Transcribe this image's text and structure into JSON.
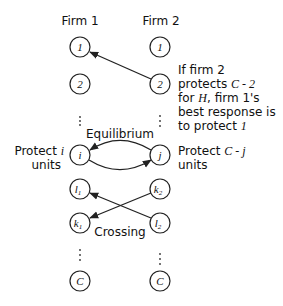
{
  "columns": [
    {
      "id": "firm1",
      "label": "Firm 1",
      "x": 80
    },
    {
      "id": "firm2",
      "label": "Firm 2",
      "x": 160
    }
  ],
  "nodes": {
    "firm1": [
      {
        "id": "f1-1",
        "label": "1",
        "sub": "",
        "y": 47
      },
      {
        "id": "f1-2",
        "label": "2",
        "sub": "",
        "y": 84
      },
      {
        "id": "f1-i",
        "label": "i",
        "sub": "",
        "y": 155
      },
      {
        "id": "f1-l1",
        "label": "l",
        "sub": "1",
        "y": 189
      },
      {
        "id": "f1-k1",
        "label": "k",
        "sub": "1",
        "y": 223
      },
      {
        "id": "f1-C",
        "label": "C",
        "sub": "",
        "y": 281
      }
    ],
    "firm2": [
      {
        "id": "f2-1",
        "label": "1",
        "sub": "",
        "y": 47
      },
      {
        "id": "f2-2",
        "label": "2",
        "sub": "",
        "y": 84
      },
      {
        "id": "f2-j",
        "label": "j",
        "sub": "",
        "y": 155
      },
      {
        "id": "f2-k2",
        "label": "k",
        "sub": "2",
        "y": 189
      },
      {
        "id": "f2-l2",
        "label": "l",
        "sub": "2",
        "y": 223
      },
      {
        "id": "f2-C",
        "label": "C",
        "sub": "",
        "y": 281
      }
    ]
  },
  "edges": [
    {
      "from": "f2-2",
      "to": "f1-1",
      "type": "straight"
    },
    {
      "from": "f2-j",
      "to": "f1-i",
      "type": "arc-upper"
    },
    {
      "from": "f1-i",
      "to": "f2-j",
      "type": "arc-lower"
    },
    {
      "from": "f2-l2",
      "to": "f1-l1",
      "type": "straight"
    },
    {
      "from": "f2-k2",
      "to": "f1-k1",
      "type": "straight"
    }
  ],
  "annotations": {
    "best_response": {
      "lines": [
        {
          "parts": [
            {
              "t": "If firm 2",
              "i": false
            }
          ]
        },
        {
          "parts": [
            {
              "t": "protects ",
              "i": false
            },
            {
              "t": "C - 2",
              "i": true
            }
          ]
        },
        {
          "parts": [
            {
              "t": "for ",
              "i": false
            },
            {
              "t": "H",
              "i": true
            },
            {
              "t": ", firm 1's",
              "i": false
            }
          ]
        },
        {
          "parts": [
            {
              "t": "best response is",
              "i": false
            }
          ]
        },
        {
          "parts": [
            {
              "t": "to protect ",
              "i": false
            },
            {
              "t": "1",
              "i": true
            }
          ]
        }
      ]
    },
    "equilibrium_label": "Equilibrium",
    "crossing_label": "Crossing",
    "protect_i": {
      "line1": "Protect ",
      "var": "i",
      "line2": "units"
    },
    "protect_cj": {
      "line1": "Protect ",
      "var": "C - j",
      "line2": "units"
    }
  }
}
